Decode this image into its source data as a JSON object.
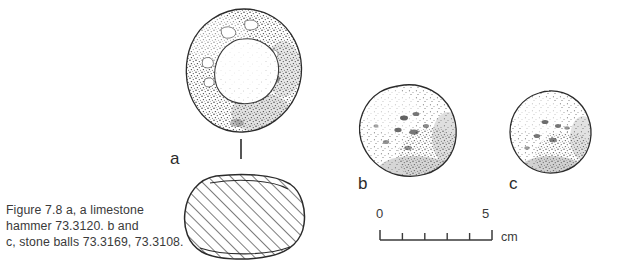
{
  "figure": {
    "number": "7.8",
    "caption_lines": [
      "Figure 7.8  a, a limestone",
      "hammer 73.3120. b and",
      "c, stone balls 73.3169, 73.3108."
    ],
    "caption_full": "Figure 7.8 a, a limestone hammer 73.3120. b and c, stone balls 73.3169, 73.3108."
  },
  "plates": [
    {
      "label": "a",
      "object": "limestone hammer",
      "accession": "73.3120",
      "views": [
        "plan with central pecked depression",
        "hatched cross-section"
      ]
    },
    {
      "label": "b",
      "object": "stone ball",
      "accession": "73.3169",
      "views": [
        "stippled exterior"
      ]
    },
    {
      "label": "c",
      "object": "stone ball",
      "accession": "73.3108",
      "views": [
        "stippled exterior"
      ]
    }
  ],
  "scale": {
    "start_label": "0",
    "end_label": "5",
    "unit": "cm",
    "ticks": [
      0,
      1,
      2,
      3,
      4,
      5
    ],
    "length_cm": 5
  },
  "colors": {
    "background": "#ffffff",
    "ink": "#2b2b2b",
    "caption_ink": "#3a3a3a",
    "stipple": "#4a4a4a"
  },
  "icons": {
    "section_tick": "section-indicator-tick"
  }
}
